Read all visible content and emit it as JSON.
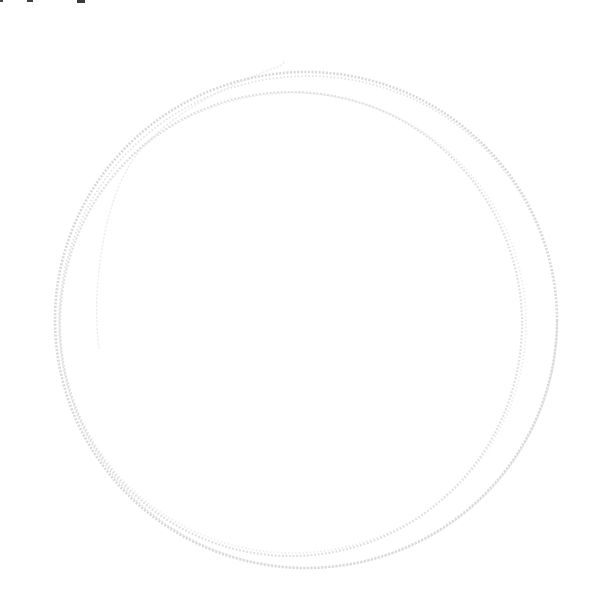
{
  "canvas": {
    "width": 607,
    "height": 604,
    "background_color": "#ffffff"
  },
  "sketch": {
    "label": "faint hand-drawn pencil circle scribble",
    "loops": [
      {
        "name": "outer-loop",
        "cx": 306,
        "cy": 320,
        "rx": 251,
        "ry": 248,
        "color": "#d6d6d6",
        "width": 2.6,
        "dash": "2 1.6",
        "opacity": 0.95
      },
      {
        "name": "outer-loop-echo",
        "cx": 308,
        "cy": 322,
        "rx": 249,
        "ry": 246,
        "color": "#dedede",
        "width": 1.8,
        "dash": "1.4 2.2",
        "opacity": 0.9
      },
      {
        "name": "inner-loop",
        "cx": 291,
        "cy": 324,
        "rx": 231,
        "ry": 232,
        "color": "#dbdbdb",
        "width": 2.2,
        "dash": "1.8 1.8",
        "opacity": 0.9
      },
      {
        "name": "inner-loop-echo",
        "cx": 293,
        "cy": 323,
        "rx": 233,
        "ry": 230,
        "color": "#e4e4e4",
        "width": 1.6,
        "dash": "1.2 2.4",
        "opacity": 0.85
      }
    ],
    "tail": {
      "name": "start-tail-stroke",
      "path": "M 284 62 q -2 3 -4 4 C 240 80 180 106 141 149 C 113 181 100 240 97 295 C 96 315 97 332 99 348",
      "color": "#e7e7e7",
      "width": 1.4,
      "dash": "1.2 2.6",
      "opacity": 0.8
    },
    "artifacts": [
      {
        "name": "cropped-glyph-artifact",
        "x": 0,
        "y": 0,
        "w": 3,
        "h": 2,
        "color": "#4a4a4a"
      },
      {
        "name": "cropped-glyph-artifact",
        "x": 27,
        "y": 0,
        "w": 6,
        "h": 2,
        "color": "#3f3f3f"
      },
      {
        "name": "cropped-glyph-artifact",
        "x": 77,
        "y": 0,
        "w": 8,
        "h": 3,
        "color": "#3a3a3a"
      }
    ]
  }
}
